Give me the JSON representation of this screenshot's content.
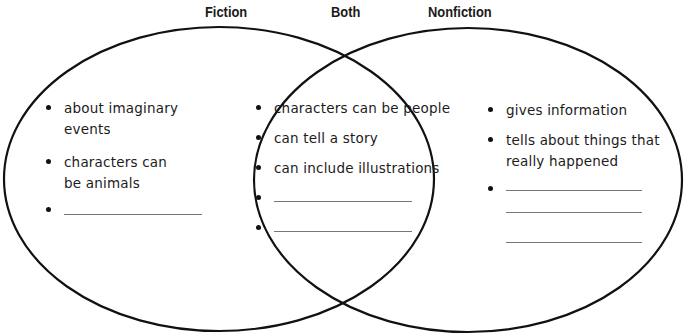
{
  "headings": {
    "left": "Fiction",
    "center": "Both",
    "right": "Nonfiction"
  },
  "colors": {
    "outline": "#111111",
    "text": "#1c1c1c",
    "blank_line": "#777777",
    "background": "#ffffff"
  },
  "regions": {
    "fiction": {
      "items": [
        {
          "text": "about imaginary events",
          "line1": "about imaginary",
          "line2": "events"
        },
        {
          "text": "characters can be animals",
          "line1": "characters can",
          "line2": "be animals"
        },
        {
          "blank": true
        }
      ]
    },
    "both": {
      "items": [
        {
          "text": "characters can be people"
        },
        {
          "text": "can tell a story"
        },
        {
          "text": "can include illustrations"
        },
        {
          "blank": true
        },
        {
          "blank": true
        }
      ]
    },
    "nonfiction": {
      "items": [
        {
          "text": "gives information"
        },
        {
          "text": "tells about things that really happened",
          "line1": "tells about things that",
          "line2": "really happened"
        },
        {
          "blank": true
        },
        {
          "blank_no_bullet": true
        },
        {
          "blank_no_bullet": true
        }
      ]
    }
  }
}
